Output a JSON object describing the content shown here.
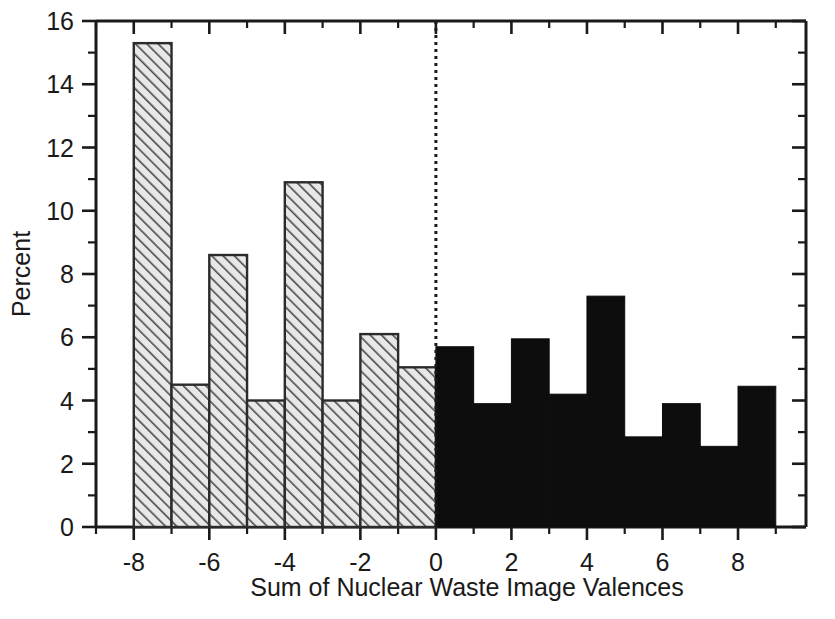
{
  "chart_data": {
    "type": "bar",
    "title": "",
    "xlabel": "Sum of Nuclear Waste Image Valences",
    "ylabel": "Percent",
    "xlim": [
      -9,
      9.8
    ],
    "ylim": [
      0,
      16
    ],
    "grid": false,
    "legend": null,
    "x_ticks_major": [
      -8,
      -6,
      -4,
      -2,
      0,
      2,
      4,
      6,
      8
    ],
    "x_tick_labels": [
      "-8",
      "-6",
      "-4",
      "-2",
      "0",
      "2",
      "4",
      "6",
      "8"
    ],
    "x_ticks_minor": [
      -9,
      -7,
      -5,
      -3,
      -1,
      1,
      3,
      5,
      7,
      9
    ],
    "y_ticks_major": [
      0,
      2,
      4,
      6,
      8,
      10,
      12,
      14,
      16
    ],
    "y_tick_labels": [
      "0",
      "2",
      "4",
      "6",
      "8",
      "10",
      "12",
      "14",
      "16"
    ],
    "y_ticks_minor": [
      1,
      3,
      5,
      7,
      9,
      11,
      13,
      15
    ],
    "bin_width": 1,
    "annotations": [
      {
        "name": "zero-reference-line",
        "x": 0,
        "style": "dotted-vertical"
      }
    ],
    "series": [
      {
        "name": "Negative valence sums",
        "fill": "hatched",
        "color": "#d9d9d9",
        "bins": [
          {
            "x0": -8,
            "x1": -7,
            "value": 15.3
          },
          {
            "x0": -7,
            "x1": -6,
            "value": 4.5
          },
          {
            "x0": -6,
            "x1": -5,
            "value": 8.6
          },
          {
            "x0": -5,
            "x1": -4,
            "value": 4.0
          },
          {
            "x0": -4,
            "x1": -3,
            "value": 10.9
          },
          {
            "x0": -3,
            "x1": -2,
            "value": 4.0
          },
          {
            "x0": -2,
            "x1": -1,
            "value": 6.1
          },
          {
            "x0": -1,
            "x1": 0,
            "value": 5.05
          }
        ]
      },
      {
        "name": "Positive valence sums",
        "fill": "solid",
        "color": "#0d0d0d",
        "bins": [
          {
            "x0": 0,
            "x1": 1,
            "value": 5.7
          },
          {
            "x0": 1,
            "x1": 2,
            "value": 3.9
          },
          {
            "x0": 2,
            "x1": 3,
            "value": 5.95
          },
          {
            "x0": 3,
            "x1": 4,
            "value": 4.2
          },
          {
            "x0": 4,
            "x1": 5,
            "value": 7.3
          },
          {
            "x0": 5,
            "x1": 6,
            "value": 2.85
          },
          {
            "x0": 6,
            "x1": 7,
            "value": 3.9
          },
          {
            "x0": 7,
            "x1": 8,
            "value": 2.55
          },
          {
            "x0": 8,
            "x1": 9,
            "value": 4.45
          }
        ]
      }
    ]
  }
}
